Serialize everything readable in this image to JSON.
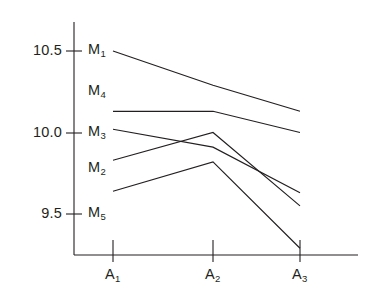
{
  "chart_data": {
    "type": "line",
    "title": "",
    "xlabel": "",
    "ylabel": "",
    "categories": [
      "A1",
      "A2",
      "A3"
    ],
    "category_labels": [
      "A",
      "A",
      "A"
    ],
    "category_subscripts": [
      "1",
      "2",
      "3"
    ],
    "ylim": [
      9.22,
      10.62
    ],
    "yticks": [
      10.5,
      10.0,
      9.5
    ],
    "ytick_labels": [
      "10.5",
      "10.0",
      "9.5"
    ],
    "grid": false,
    "legend": "inline-left-labels",
    "series": [
      {
        "name": "M1",
        "label_base": "M",
        "label_sub": "1",
        "values": [
          10.5,
          10.29,
          10.13
        ]
      },
      {
        "name": "M4",
        "label_base": "M",
        "label_sub": "4",
        "values": [
          10.13,
          10.13,
          10.0
        ]
      },
      {
        "name": "M3",
        "label_base": "M",
        "label_sub": "3",
        "values": [
          10.02,
          9.91,
          9.63
        ]
      },
      {
        "name": "M2",
        "label_base": "M",
        "label_sub": "2",
        "values": [
          9.83,
          10.0,
          9.55
        ]
      },
      {
        "name": "M5",
        "label_base": "M",
        "label_sub": "5",
        "values": [
          9.64,
          9.82,
          9.29
        ]
      }
    ],
    "series_label_y_values": [
      10.5,
      10.25,
      10.0,
      9.78,
      9.5
    ],
    "line_color": "#231f20",
    "background_color": "#ffffff"
  },
  "axes": {
    "y_axis_name": "value-axis",
    "x_axis_name": "category-axis"
  }
}
